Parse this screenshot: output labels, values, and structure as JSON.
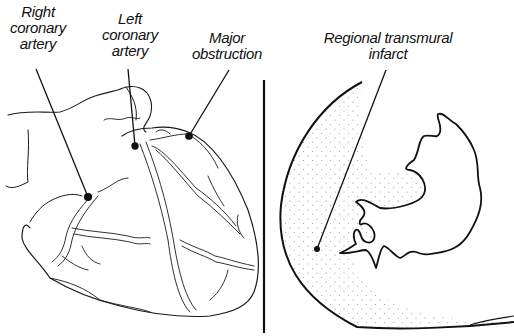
{
  "figure": {
    "left_panel": {
      "name": "heart-exterior",
      "labels": {
        "right_coronary": [
          "Right",
          "coronary",
          "artery"
        ],
        "left_coronary": [
          "Left",
          "coronary",
          "artery"
        ],
        "major_obstruction": [
          "Major",
          "obstruction"
        ]
      }
    },
    "right_panel": {
      "name": "ventricle-cross-section",
      "labels": {
        "infarct": [
          "Regional transmural",
          "infarct"
        ]
      }
    },
    "colors": {
      "ink": "#111111",
      "background": "#ffffff",
      "stipple": "#8a8a8a"
    }
  }
}
